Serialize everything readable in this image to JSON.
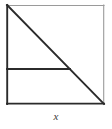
{
  "figure": {
    "kind": "geometry-diagram",
    "label": "x",
    "caption": "x",
    "colors": {
      "stroke_dark": "#2b2b2b",
      "stroke_light": "#9a9a9a",
      "background": "#ffffff",
      "label_color": "#3a3a3a"
    },
    "geometry": {
      "square": {
        "left": 7,
        "top": 5,
        "right": 104,
        "bottom": 104,
        "width": 97,
        "height": 99
      },
      "edges": [
        {
          "name": "top-edge",
          "x1": 7,
          "y1": 5,
          "x2": 104,
          "y2": 5,
          "weight": "thin"
        },
        {
          "name": "right-edge",
          "x1": 104,
          "y1": 5,
          "x2": 104,
          "y2": 104,
          "weight": "thin"
        },
        {
          "name": "bottom-edge",
          "x1": 7,
          "y1": 104,
          "x2": 104,
          "y2": 104,
          "weight": "thick"
        },
        {
          "name": "left-edge",
          "x1": 7,
          "y1": 5,
          "x2": 7,
          "y2": 104,
          "weight": "thick"
        }
      ],
      "diagonal": {
        "name": "diagonal",
        "x1": 7,
        "y1": 5,
        "x2": 104,
        "y2": 104,
        "weight": "thick"
      },
      "interior_horizontal": {
        "name": "interior-horizontal",
        "x1": 7,
        "y1": 69,
        "x2": 70,
        "y2": 69,
        "weight": "thick"
      }
    }
  }
}
